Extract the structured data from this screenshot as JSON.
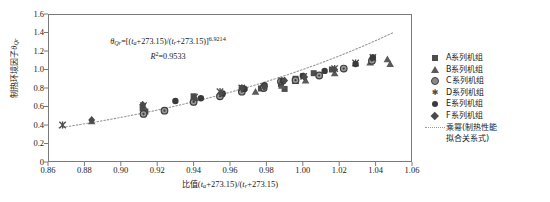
{
  "chart_data": {
    "type": "scatter",
    "title": "",
    "xlabel": "比值(t_a+273.15)/(t_r+273.15)",
    "ylabel": "制热环境因子 θ_Qr",
    "xlim": [
      0.86,
      1.06
    ],
    "ylim": [
      0,
      1.6
    ],
    "xticks": [
      "0.86",
      "0.88",
      "0.90",
      "0.92",
      "0.94",
      "0.96",
      "0.98",
      "1.00",
      "1.02",
      "1.04",
      "1.06"
    ],
    "yticks": [
      "0",
      "0.2",
      "0.4",
      "0.6",
      "0.8",
      "1.0",
      "1.2",
      "1.4",
      "1.6"
    ],
    "grid": false,
    "legend_position": "right-outside",
    "annotation": {
      "equation": "θ_Qr=[(t_a+273.15)/(t_r+273.15)]^6.9214",
      "r_squared": "R²=0.9533",
      "exponent": "6.9214",
      "r2_value": "0.9533"
    },
    "series": [
      {
        "name": "A系列机组",
        "marker": "filled-square",
        "color": "#4d4d4d",
        "points": [
          [
            0.912,
            0.58
          ],
          [
            0.9135,
            0.545
          ],
          [
            0.94,
            0.71
          ],
          [
            0.9555,
            0.735
          ],
          [
            0.9665,
            0.8
          ],
          [
            0.977,
            0.795
          ],
          [
            0.988,
            0.84
          ],
          [
            0.99,
            0.79
          ],
          [
            0.996,
            0.9
          ],
          [
            1.006,
            0.96
          ],
          [
            1.016,
            1.0
          ]
        ]
      },
      {
        "name": "B系列机组",
        "marker": "filled-triangle",
        "color": "#5a5a5a",
        "points": [
          [
            0.884,
            0.44
          ],
          [
            0.9405,
            0.69
          ],
          [
            0.955,
            0.735
          ],
          [
            0.974,
            0.76
          ],
          [
            0.9885,
            0.825
          ],
          [
            0.996,
            0.875
          ],
          [
            1.0015,
            0.88
          ],
          [
            1.0175,
            0.96
          ],
          [
            1.037,
            1.075
          ],
          [
            1.0465,
            1.11
          ],
          [
            1.048,
            1.06
          ]
        ]
      },
      {
        "name": "C系列机组",
        "marker": "patterned-circle",
        "color": "#8a8a8a",
        "points": [
          [
            0.9125,
            0.52
          ],
          [
            0.924,
            0.555
          ],
          [
            0.94,
            0.65
          ],
          [
            0.9545,
            0.71
          ],
          [
            0.9665,
            0.76
          ],
          [
            0.9785,
            0.8
          ],
          [
            0.988,
            0.87
          ],
          [
            0.996,
            0.885
          ],
          [
            1.009,
            0.935
          ],
          [
            1.0225,
            1.01
          ],
          [
            1.038,
            1.095
          ]
        ]
      },
      {
        "name": "D系列机组",
        "marker": "x-asterisk",
        "color": "#4d4d4d",
        "points": [
          [
            0.868,
            0.4
          ],
          [
            0.9125,
            0.61
          ],
          [
            0.9405,
            0.7
          ],
          [
            0.9545,
            0.76
          ],
          [
            0.9665,
            0.8
          ],
          [
            0.9785,
            0.815
          ],
          [
            0.9885,
            0.88
          ],
          [
            1.0005,
            0.925
          ],
          [
            1.0175,
            1.01
          ],
          [
            1.029,
            1.07
          ],
          [
            1.0385,
            1.13
          ]
        ]
      },
      {
        "name": "E系列机组",
        "marker": "filled-circle",
        "color": "#3a3a3a",
        "points": [
          [
            0.93,
            0.66
          ],
          [
            0.944,
            0.69
          ],
          [
            0.956,
            0.74
          ],
          [
            0.968,
            0.79
          ],
          [
            0.979,
            0.83
          ],
          [
            0.989,
            0.875
          ],
          [
            1.0,
            0.93
          ],
          [
            1.012,
            0.985
          ],
          [
            1.029,
            1.06
          ],
          [
            1.0385,
            1.13
          ]
        ]
      },
      {
        "name": "F系列机组",
        "marker": "filled-diamond",
        "color": "#4a4a4a",
        "points": [
          [
            0.884,
            0.455
          ],
          [
            0.912,
            0.62
          ],
          [
            0.9405,
            0.69
          ],
          [
            0.955,
            0.745
          ],
          [
            0.9665,
            0.8
          ],
          [
            0.979,
            0.815
          ],
          [
            0.99,
            0.88
          ],
          [
            1.001,
            0.92
          ],
          [
            1.0175,
            1.0
          ]
        ]
      }
    ],
    "fit_curve": {
      "name": "乘幂(制热性能拟合关系式)",
      "style": "dotted",
      "color": "#9a9a9a",
      "exponent": 6.9214
    }
  },
  "axes": {
    "y_label_parts": {
      "cjk": "制热环境因子",
      "symbol": "θ",
      "subscript": "Qr"
    },
    "x_label_parts": {
      "cjk": "比值",
      "expr": "(t_a+273.15)/(t_r+273.15)"
    }
  },
  "legend": {
    "entries": [
      {
        "label": "A系列机组",
        "marker": "filled-square"
      },
      {
        "label": "B系列机组",
        "marker": "filled-triangle"
      },
      {
        "label": "C系列机组",
        "marker": "patterned-circle"
      },
      {
        "label": "D系列机组",
        "marker": "x-asterisk"
      },
      {
        "label": "E系列机组",
        "marker": "filled-circle"
      },
      {
        "label": "F系列机组",
        "marker": "filled-diamond"
      }
    ],
    "fit_entry": {
      "line1": "乘幂(制热性能",
      "line2": "拟合关系式)",
      "marker": "dotted-line"
    }
  },
  "colors": {
    "frame": "#7a7a7a",
    "text": "#1a1a1a",
    "fit_line": "#9a9a9a",
    "background": "#ffffff"
  }
}
